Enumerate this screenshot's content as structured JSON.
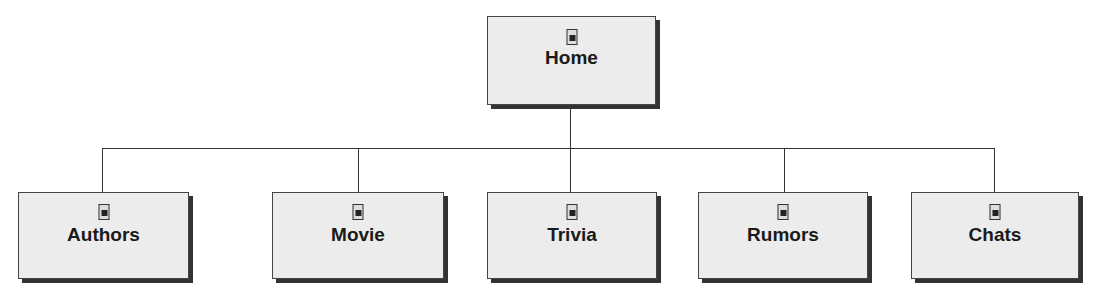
{
  "diagram": {
    "type": "site-map-hierarchy",
    "root": {
      "label": "Home",
      "icon": "page-icon"
    },
    "children": [
      {
        "label": "Authors",
        "icon": "page-icon"
      },
      {
        "label": "Movie",
        "icon": "page-icon"
      },
      {
        "label": "Trivia",
        "icon": "page-icon"
      },
      {
        "label": "Rumors",
        "icon": "page-icon"
      },
      {
        "label": "Chats",
        "icon": "page-icon"
      }
    ]
  }
}
